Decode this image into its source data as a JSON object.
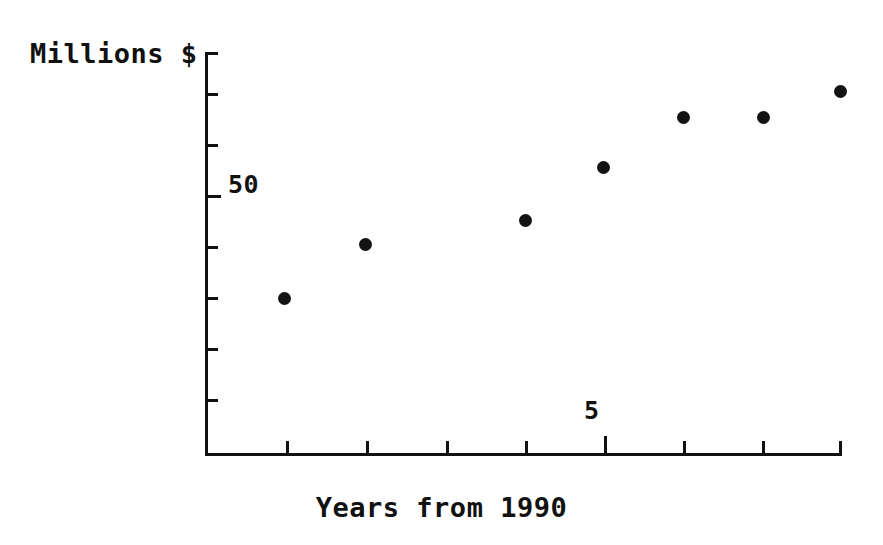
{
  "chart_data": {
    "type": "scatter",
    "title": "",
    "xlabel": "Years from 1990",
    "ylabel": "Millions $",
    "x": [
      1,
      2,
      4,
      5,
      6,
      7,
      8
    ],
    "values": [
      20.5,
      31.5,
      43.5,
      54,
      63.5,
      63.5,
      68.5
    ],
    "series": [
      {
        "name": "Millions $",
        "x": [
          1,
          2,
          4,
          5,
          6,
          7,
          8
        ],
        "values": [
          20.5,
          31.5,
          43.5,
          54,
          63.5,
          63.5,
          68.5
        ]
      }
    ],
    "xlim": [
      0,
      8
    ],
    "ylim": [
      0,
      101
    ],
    "xticks": [
      1,
      2,
      3,
      4,
      5,
      6,
      7,
      8
    ],
    "yticks": [
      0,
      12.5,
      25,
      37.5,
      50,
      62.5,
      75,
      87.5,
      100
    ],
    "xtick_labels": [
      "",
      "",
      "",
      "",
      "5",
      "",
      "",
      ""
    ],
    "ytick_labels": [
      "",
      "",
      "",
      "",
      "50",
      "",
      "",
      "",
      ""
    ],
    "grid": false,
    "legend": false,
    "marker": "filled-circle",
    "marker_color": "#131313",
    "axis_color": "#111111",
    "background": "#ffffff"
  },
  "axes": {
    "y_axis_label": "Millions $",
    "x_axis_label": "Years from 1990",
    "y_tick_label": "50",
    "x_tick_label": "5"
  },
  "points": [
    {
      "label": "point-1",
      "left": 278,
      "top": 292
    },
    {
      "label": "point-2",
      "left": 359,
      "top": 238
    },
    {
      "label": "point-3",
      "left": 519,
      "top": 214
    },
    {
      "label": "point-4",
      "left": 597,
      "top": 161
    },
    {
      "label": "point-5",
      "left": 677,
      "top": 111
    },
    {
      "label": "point-6",
      "left": 757,
      "top": 111
    },
    {
      "label": "point-7",
      "left": 834,
      "top": 85
    }
  ],
  "y_ticks": [
    {
      "top": 52,
      "major": false
    },
    {
      "top": 93,
      "major": false
    },
    {
      "top": 144,
      "major": false
    },
    {
      "top": 195,
      "major": true
    },
    {
      "top": 246,
      "major": false
    },
    {
      "top": 297,
      "major": false
    },
    {
      "top": 348,
      "major": false
    },
    {
      "top": 399,
      "major": false
    }
  ],
  "x_ticks": [
    {
      "left": 286,
      "major": false
    },
    {
      "left": 366,
      "major": false
    },
    {
      "left": 446,
      "major": false
    },
    {
      "left": 525,
      "major": false
    },
    {
      "left": 604,
      "major": true
    },
    {
      "left": 683,
      "major": false
    },
    {
      "left": 762,
      "major": false
    },
    {
      "left": 839,
      "major": false
    }
  ]
}
